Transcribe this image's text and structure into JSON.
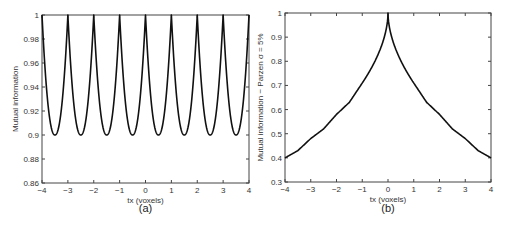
{
  "chart_data": [
    {
      "type": "line",
      "panel_label": "(a)",
      "title": "",
      "xlabel": "tx (voxels)",
      "ylabel": "Mutual information",
      "xlim": [
        -4,
        4
      ],
      "ylim": [
        0.86,
        1
      ],
      "xticks": [
        -4,
        -3,
        -2,
        -1,
        0,
        1,
        2,
        3,
        4
      ],
      "xtick_labels": [
        "−4",
        "−3",
        "−2",
        "−1",
        "0",
        "1",
        "2",
        "3",
        "4"
      ],
      "yticks": [
        0.86,
        0.88,
        0.9,
        0.92,
        0.94,
        0.96,
        0.98,
        1
      ],
      "ytick_labels": [
        "0.86",
        "0.88",
        "0.9",
        "0.92",
        "0.94",
        "0.96",
        "0.98",
        "1"
      ],
      "grid": false,
      "series": [
        {
          "name": "Mutual information",
          "description": "periodic with period 1 voxel; peaks of 1.0 at integer tx, minima of 0.90 at half-integer tx",
          "x": [
            -4,
            -3.5,
            -3,
            -2.5,
            -2,
            -1.5,
            -1,
            -0.5,
            0,
            0.5,
            1,
            1.5,
            2,
            2.5,
            3,
            3.5,
            4
          ],
          "y": [
            1,
            0.9,
            1,
            0.9,
            1,
            0.9,
            1,
            0.9,
            1,
            0.9,
            1,
            0.9,
            1,
            0.9,
            1,
            0.9,
            1
          ]
        }
      ]
    },
    {
      "type": "line",
      "panel_label": "(b)",
      "title": "",
      "xlabel": "tx (voxels)",
      "ylabel": "Mutual information − Parzen σ = 5%",
      "xlim": [
        -4,
        4
      ],
      "ylim": [
        0.3,
        1
      ],
      "xticks": [
        -4,
        -3,
        -2,
        -1,
        0,
        1,
        2,
        3,
        4
      ],
      "xtick_labels": [
        "−4",
        "−3",
        "−2",
        "−1",
        "0",
        "1",
        "2",
        "3",
        "4"
      ],
      "yticks": [
        0.3,
        0.4,
        0.5,
        0.6,
        0.7,
        0.8,
        0.9,
        1
      ],
      "ytick_labels": [
        "0.3",
        "0.4",
        "0.5",
        "0.6",
        "0.7",
        "0.8",
        "0.9",
        "1"
      ],
      "grid": false,
      "series": [
        {
          "name": "Mutual information (Parzen)",
          "description": "symmetric peak of 1.0 at tx=0, decreasing with small kinks at integer tx",
          "x": [
            -4,
            -3.5,
            -3,
            -2.5,
            -2,
            -1.5,
            -1,
            -0.5,
            0,
            0.5,
            1,
            1.5,
            2,
            2.5,
            3,
            3.5,
            4
          ],
          "y": [
            0.4,
            0.43,
            0.48,
            0.52,
            0.58,
            0.63,
            0.71,
            0.8,
            1,
            0.8,
            0.71,
            0.63,
            0.58,
            0.52,
            0.48,
            0.43,
            0.4
          ]
        }
      ]
    }
  ]
}
